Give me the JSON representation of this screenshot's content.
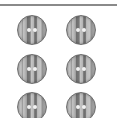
{
  "image": {
    "subject": "striped sewing buttons",
    "count": 6,
    "layout": {
      "columns": 2,
      "rows_visible": 3
    },
    "button_holes": 2,
    "colors": {
      "background": "#ffffff",
      "top_rule": "#8a8a8a",
      "stripe_light": "#c8c8c8",
      "stripe_dark": "#6e6e6e",
      "rim": "#6f6f6f",
      "holes": "#f2f2f2"
    }
  }
}
